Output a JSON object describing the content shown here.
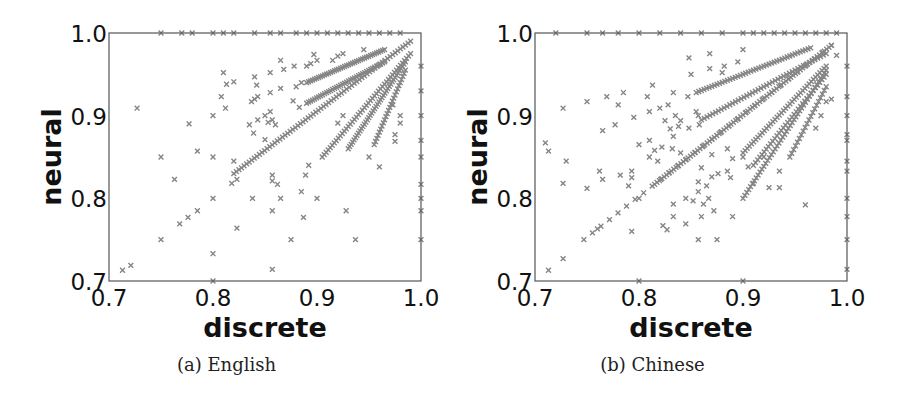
{
  "figure": {
    "captions": [
      "(a) English",
      "(b) Chinese"
    ]
  },
  "style": {
    "marker_color": "#858585",
    "axis_color": "#555555",
    "text_color": "#111111"
  },
  "chart_data": [
    {
      "type": "scatter",
      "title": "(a) English",
      "xlabel": "discrete",
      "ylabel": "neural",
      "xlim": [
        0.7,
        1.0
      ],
      "ylim": [
        0.7,
        1.0
      ],
      "xticks": [
        "0.7",
        "0.8",
        "0.9",
        "1.0"
      ],
      "yticks": [
        "0.7",
        "0.8",
        "0.9",
        "1.0"
      ],
      "grid": false,
      "legend": null,
      "marker": "x",
      "rays": [
        {
          "from": [
            0.82,
            0.83
          ],
          "to": [
            0.99,
            0.99
          ],
          "n": 70
        },
        {
          "from": [
            0.89,
            0.94
          ],
          "to": [
            0.965,
            0.98
          ],
          "n": 40
        },
        {
          "from": [
            0.89,
            0.915
          ],
          "to": [
            0.965,
            0.965
          ],
          "n": 40
        },
        {
          "from": [
            0.905,
            0.85
          ],
          "to": [
            0.99,
            0.975
          ],
          "n": 45
        },
        {
          "from": [
            0.93,
            0.86
          ],
          "to": [
            0.985,
            0.965
          ],
          "n": 40
        },
        {
          "from": [
            0.955,
            0.865
          ],
          "to": [
            0.985,
            0.955
          ],
          "n": 25
        }
      ],
      "points": [
        [
          0.713,
          0.713
        ],
        [
          0.721,
          0.719
        ],
        [
          0.727,
          0.909
        ],
        [
          0.75,
          0.75
        ],
        [
          0.75,
          0.85
        ],
        [
          0.763,
          0.823
        ],
        [
          0.768,
          0.769
        ],
        [
          0.776,
          0.777
        ],
        [
          0.777,
          0.89
        ],
        [
          0.785,
          0.785
        ],
        [
          0.785,
          0.857
        ],
        [
          0.8,
          0.8
        ],
        [
          0.8,
          0.85
        ],
        [
          0.8,
          0.9
        ],
        [
          0.8,
          0.733
        ],
        [
          0.808,
          0.923
        ],
        [
          0.81,
          0.952
        ],
        [
          0.812,
          0.909
        ],
        [
          0.813,
          0.938
        ],
        [
          0.818,
          0.818
        ],
        [
          0.82,
          0.845
        ],
        [
          0.823,
          0.823
        ],
        [
          0.823,
          0.764
        ],
        [
          0.82,
          0.941
        ],
        [
          0.837,
          0.917
        ],
        [
          0.84,
          0.92
        ],
        [
          0.843,
          0.923
        ],
        [
          0.84,
          0.947
        ],
        [
          0.842,
          0.937
        ],
        [
          0.835,
          0.889
        ],
        [
          0.843,
          0.895
        ],
        [
          0.839,
          0.879
        ],
        [
          0.838,
          0.8
        ],
        [
          0.85,
          0.9
        ],
        [
          0.855,
          0.905
        ],
        [
          0.85,
          0.871
        ],
        [
          0.853,
          0.892
        ],
        [
          0.857,
          0.895
        ],
        [
          0.86,
          0.889
        ],
        [
          0.855,
          0.952
        ],
        [
          0.855,
          0.928
        ],
        [
          0.865,
          0.967
        ],
        [
          0.868,
          0.956
        ],
        [
          0.865,
          0.933
        ],
        [
          0.862,
          0.817
        ],
        [
          0.857,
          0.828
        ],
        [
          0.857,
          0.821
        ],
        [
          0.857,
          0.785
        ],
        [
          0.857,
          0.714
        ],
        [
          0.865,
          0.8
        ],
        [
          0.875,
          0.75
        ],
        [
          0.878,
          0.96
        ],
        [
          0.88,
          0.935
        ],
        [
          0.885,
          0.94
        ],
        [
          0.89,
          0.96
        ],
        [
          0.894,
          0.963
        ],
        [
          0.897,
          0.974
        ],
        [
          0.9,
          0.967
        ],
        [
          0.877,
          0.918
        ],
        [
          0.883,
          0.91
        ],
        [
          0.885,
          0.808
        ],
        [
          0.887,
          0.777
        ],
        [
          0.889,
          0.828
        ],
        [
          0.892,
          0.84
        ],
        [
          0.9,
          0.8
        ],
        [
          0.915,
          0.967
        ],
        [
          0.92,
          0.972
        ],
        [
          0.925,
          0.975
        ],
        [
          0.928,
          0.785
        ],
        [
          0.937,
          0.75
        ],
        [
          0.92,
          0.891
        ],
        [
          0.925,
          0.9
        ],
        [
          0.95,
          0.85
        ],
        [
          0.96,
          0.838
        ],
        [
          0.975,
          0.869
        ],
        [
          0.975,
          0.877
        ],
        [
          0.98,
          0.891
        ],
        [
          0.98,
          0.9
        ],
        [
          0.973,
          0.913
        ],
        [
          0.945,
          0.98
        ]
      ],
      "top_edge_x": [
        0.75,
        0.77,
        0.78,
        0.8,
        0.81,
        0.82,
        0.84,
        0.855,
        0.865,
        0.88,
        0.89,
        0.9,
        0.91,
        0.92,
        0.93,
        0.94,
        0.95,
        0.96,
        0.97,
        0.98
      ],
      "right_edge_y": [
        0.75,
        0.785,
        0.8,
        0.817,
        0.85,
        0.87,
        0.9,
        0.93,
        0.96
      ],
      "bottom_edge_x": [
        0.8
      ]
    },
    {
      "type": "scatter",
      "title": "(b) Chinese",
      "xlabel": "discrete",
      "ylabel": "neural",
      "xlim": [
        0.7,
        1.0
      ],
      "ylim": [
        0.7,
        1.0
      ],
      "xticks": [
        "0.7",
        "0.8",
        "0.9",
        "1.0"
      ],
      "yticks": [
        "0.7",
        "0.8",
        "0.9",
        "1.0"
      ],
      "grid": false,
      "legend": null,
      "marker": "x",
      "rays": [
        {
          "from": [
            0.747,
            0.75
          ],
          "to": [
            0.985,
            0.985
          ],
          "n": 30
        },
        {
          "from": [
            0.815,
            0.817
          ],
          "to": [
            0.985,
            0.985
          ],
          "n": 75
        },
        {
          "from": [
            0.855,
            0.928
          ],
          "to": [
            0.965,
            0.982
          ],
          "n": 45
        },
        {
          "from": [
            0.86,
            0.895
          ],
          "to": [
            0.98,
            0.975
          ],
          "n": 45
        },
        {
          "from": [
            0.9,
            0.855
          ],
          "to": [
            0.98,
            0.96
          ],
          "n": 40
        },
        {
          "from": [
            0.9,
            0.8
          ],
          "to": [
            0.98,
            0.955
          ],
          "n": 45
        },
        {
          "from": [
            0.91,
            0.84
          ],
          "to": [
            0.98,
            0.95
          ],
          "n": 35
        },
        {
          "from": [
            0.945,
            0.85
          ],
          "to": [
            0.98,
            0.935
          ],
          "n": 20
        }
      ],
      "points": [
        [
          0.71,
          0.867
        ],
        [
          0.713,
          0.857
        ],
        [
          0.713,
          0.713
        ],
        [
          0.727,
          0.727
        ],
        [
          0.727,
          0.909
        ],
        [
          0.727,
          0.818
        ],
        [
          0.73,
          0.845
        ],
        [
          0.75,
          0.917
        ],
        [
          0.75,
          0.812
        ],
        [
          0.76,
          0.763
        ],
        [
          0.762,
          0.833
        ],
        [
          0.765,
          0.882
        ],
        [
          0.765,
          0.823
        ],
        [
          0.769,
          0.923
        ],
        [
          0.777,
          0.889
        ],
        [
          0.78,
          0.913
        ],
        [
          0.782,
          0.828
        ],
        [
          0.785,
          0.928
        ],
        [
          0.79,
          0.815
        ],
        [
          0.793,
          0.825
        ],
        [
          0.793,
          0.833
        ],
        [
          0.793,
          0.76
        ],
        [
          0.795,
          0.898
        ],
        [
          0.8,
          0.8
        ],
        [
          0.8,
          0.865
        ],
        [
          0.808,
          0.923
        ],
        [
          0.81,
          0.905
        ],
        [
          0.813,
          0.937
        ],
        [
          0.81,
          0.87
        ],
        [
          0.81,
          0.85
        ],
        [
          0.815,
          0.858
        ],
        [
          0.818,
          0.845
        ],
        [
          0.82,
          0.909
        ],
        [
          0.822,
          0.862
        ],
        [
          0.825,
          0.894
        ],
        [
          0.823,
          0.767
        ],
        [
          0.827,
          0.762
        ],
        [
          0.828,
          0.913
        ],
        [
          0.83,
          0.884
        ],
        [
          0.832,
          0.86
        ],
        [
          0.833,
          0.928
        ],
        [
          0.833,
          0.875
        ],
        [
          0.835,
          0.9
        ],
        [
          0.833,
          0.793
        ],
        [
          0.833,
          0.778
        ],
        [
          0.838,
          0.887
        ],
        [
          0.84,
          0.894
        ],
        [
          0.84,
          0.855
        ],
        [
          0.845,
          0.8
        ],
        [
          0.847,
          0.923
        ],
        [
          0.848,
          0.97
        ],
        [
          0.85,
          0.95
        ],
        [
          0.848,
          0.885
        ],
        [
          0.845,
          0.769
        ],
        [
          0.852,
          0.797
        ],
        [
          0.855,
          0.905
        ],
        [
          0.857,
          0.9
        ],
        [
          0.858,
          0.889
        ],
        [
          0.857,
          0.75
        ],
        [
          0.857,
          0.808
        ],
        [
          0.857,
          0.82
        ],
        [
          0.86,
          0.837
        ],
        [
          0.86,
          0.778
        ],
        [
          0.862,
          0.793
        ],
        [
          0.865,
          0.815
        ],
        [
          0.867,
          0.8
        ],
        [
          0.868,
          0.975
        ],
        [
          0.868,
          0.957
        ],
        [
          0.87,
          0.853
        ],
        [
          0.87,
          0.826
        ],
        [
          0.872,
          0.785
        ],
        [
          0.875,
          0.75
        ],
        [
          0.876,
          0.83
        ],
        [
          0.88,
          0.952
        ],
        [
          0.882,
          0.96
        ],
        [
          0.885,
          0.86
        ],
        [
          0.885,
          0.833
        ],
        [
          0.888,
          0.825
        ],
        [
          0.89,
          0.778
        ],
        [
          0.89,
          0.848
        ],
        [
          0.895,
          0.965
        ],
        [
          0.9,
          0.98
        ],
        [
          0.9,
          0.85
        ],
        [
          0.905,
          0.838
        ],
        [
          0.91,
          0.818
        ],
        [
          0.92,
          0.85
        ],
        [
          0.925,
          0.813
        ],
        [
          0.935,
          0.813
        ],
        [
          0.935,
          0.833
        ],
        [
          0.96,
          0.792
        ],
        [
          0.97,
          0.885
        ],
        [
          0.975,
          0.9
        ],
        [
          0.985,
          0.92
        ],
        [
          0.99,
          0.973
        ],
        [
          0.98,
          0.917
        ]
      ],
      "top_edge_x": [
        0.72,
        0.75,
        0.765,
        0.78,
        0.8,
        0.82,
        0.84,
        0.86,
        0.88,
        0.9,
        0.91,
        0.92,
        0.93,
        0.94,
        0.95,
        0.96,
        0.97,
        0.98,
        0.99
      ],
      "right_edge_y": [
        0.714,
        0.75,
        0.778,
        0.8,
        0.833,
        0.845,
        0.87,
        0.877,
        0.9,
        0.923,
        0.96
      ],
      "bottom_edge_x": [
        0.8,
        0.9
      ]
    }
  ]
}
